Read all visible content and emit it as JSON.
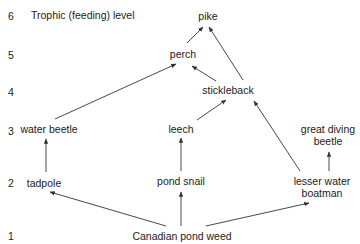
{
  "diagram": {
    "title": "Trophic (feeding) level",
    "levels": [
      {
        "n": "6",
        "y": 16
      },
      {
        "n": "5",
        "y": 55
      },
      {
        "n": "4",
        "y": 92
      },
      {
        "n": "3",
        "y": 131
      },
      {
        "n": "2",
        "y": 183
      },
      {
        "n": "1",
        "y": 236
      }
    ],
    "nodes": {
      "pike": "pike",
      "perch": "perch",
      "stickleback": "stickleback",
      "water_beetle": "water beetle",
      "leech": "leech",
      "great_diving_beetle_1": "great diving",
      "great_diving_beetle_2": "beetle",
      "tadpole": "tadpole",
      "pond_snail": "pond snail",
      "lesser_water_boatman_1": "lesser water",
      "lesser_water_boatman_2": "boatman",
      "canadian_pond_weed": "Canadian pond weed"
    },
    "edges": [
      [
        "canadian_pond_weed",
        "tadpole"
      ],
      [
        "canadian_pond_weed",
        "pond_snail"
      ],
      [
        "canadian_pond_weed",
        "lesser_water_boatman"
      ],
      [
        "tadpole",
        "water_beetle"
      ],
      [
        "pond_snail",
        "leech"
      ],
      [
        "lesser_water_boatman",
        "great_diving_beetle"
      ],
      [
        "lesser_water_boatman",
        "stickleback"
      ],
      [
        "leech",
        "stickleback"
      ],
      [
        "water_beetle",
        "perch"
      ],
      [
        "stickleback",
        "perch"
      ],
      [
        "stickleback",
        "pike"
      ],
      [
        "perch",
        "pike"
      ]
    ],
    "colors": {
      "line": "#333333",
      "text": "#222222"
    }
  }
}
